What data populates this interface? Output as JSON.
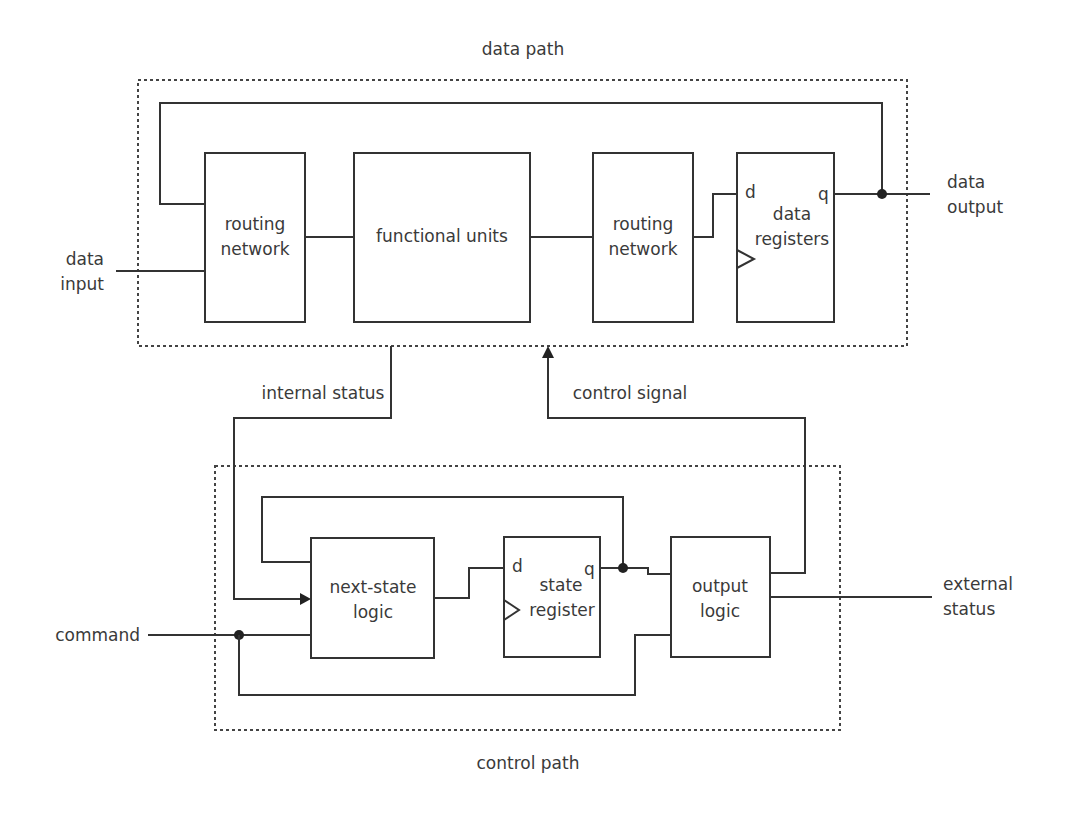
{
  "groups": {
    "data_path": {
      "label": "data path"
    },
    "control_path": {
      "label": "control path"
    }
  },
  "data_path_blocks": {
    "routing_network_in": {
      "line1": "routing",
      "line2": "network"
    },
    "functional_units": {
      "label": "functional units"
    },
    "routing_network_out": {
      "line1": "routing",
      "line2": "network"
    },
    "data_registers": {
      "line1": "data",
      "line2": "registers",
      "d_pin": "d",
      "q_pin": "q"
    }
  },
  "control_path_blocks": {
    "next_state_logic": {
      "line1": "next-state",
      "line2": "logic"
    },
    "state_register": {
      "line1": "state",
      "line2": "register",
      "d_pin": "d",
      "q_pin": "q"
    },
    "output_logic": {
      "line1": "output",
      "line2": "logic"
    }
  },
  "signals": {
    "data_input": {
      "line1": "data",
      "line2": "input"
    },
    "data_output": {
      "line1": "data",
      "line2": "output"
    },
    "internal_status": {
      "label": "internal status"
    },
    "control_signal": {
      "label": "control signal"
    },
    "command": {
      "label": "command"
    },
    "external_status": {
      "line1": "external",
      "line2": "status"
    }
  },
  "colors": {
    "stroke": "#333333",
    "text": "#3a3a3a",
    "background": "#ffffff"
  }
}
